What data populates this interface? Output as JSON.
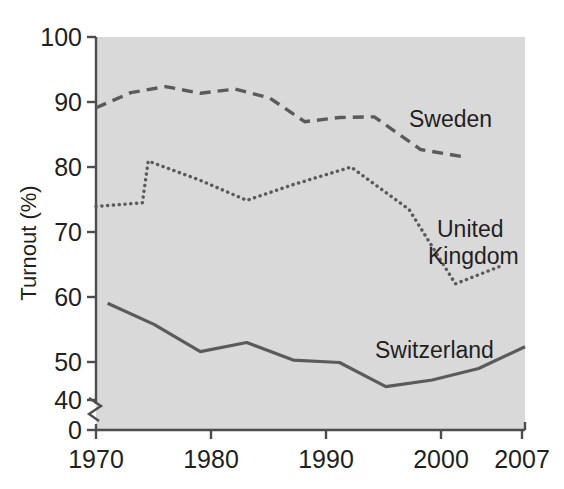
{
  "figure": {
    "background_color": "#ffffff",
    "plot_background_color": "#dedede",
    "line_color": "#5b5b5b",
    "axis_color": "#4d4d4d",
    "text_color": "#231f20"
  },
  "axes": {
    "y_title": "Turnout (%)",
    "y_ticks": [
      "0",
      "40",
      "50",
      "60",
      "70",
      "80",
      "90",
      "100"
    ],
    "x_ticks": [
      "1970",
      "1980",
      "1990",
      "2000",
      "2007"
    ],
    "y_break_between": [
      "0",
      "40"
    ]
  },
  "labels": {
    "sweden": "Sweden",
    "united_kingdom": "United\nKingdom",
    "united_kingdom_line1": "United",
    "united_kingdom_line2": "Kingdom",
    "switzerland": "Switzerland"
  },
  "chart_data": {
    "type": "line",
    "title": "",
    "xlabel": "",
    "ylabel": "Turnout (%)",
    "xlim": [
      1970,
      2007
    ],
    "ylim": [
      40,
      100
    ],
    "y_axis_break": true,
    "y_axis_break_range": [
      0,
      40
    ],
    "grid": false,
    "legend": "inline-annotations",
    "series": [
      {
        "name": "Sweden",
        "style": "dashed",
        "color": "#5b5b5b",
        "x": [
          1970,
          1973,
          1976,
          1979,
          1982,
          1985,
          1988,
          1991,
          1994,
          1998,
          2002
        ],
        "values": [
          88.3,
          90.8,
          91.8,
          90.7,
          91.4,
          89.9,
          86.0,
          86.7,
          86.8,
          81.4,
          80.1
        ]
      },
      {
        "name": "United Kingdom",
        "style": "dotted",
        "color": "#5b5b5b",
        "x": [
          1970,
          1974.0,
          1974.5,
          1979,
          1983,
          1987,
          1992,
          1997,
          2001,
          2005
        ],
        "values": [
          72.0,
          72.6,
          79.5,
          76.3,
          73.0,
          75.6,
          78.5,
          71.5,
          59.2,
          62.2
        ]
      },
      {
        "name": "Switzerland",
        "style": "solid",
        "color": "#5b5b5b",
        "x": [
          1971,
          1975,
          1979,
          1983,
          1987,
          1991,
          1995,
          1999,
          2003,
          2007
        ],
        "values": [
          56.0,
          52.5,
          48.0,
          49.5,
          46.6,
          46.2,
          42.2,
          43.3,
          45.2,
          48.8
        ]
      }
    ]
  }
}
